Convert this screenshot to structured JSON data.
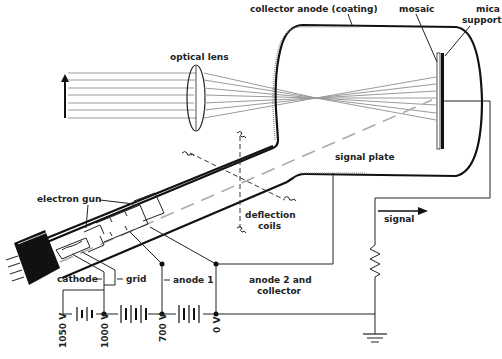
{
  "diagram": {
    "labels": {
      "optical_lens": "optical lens",
      "collector_anode": "collector anode (coating)",
      "mosaic": "mosaic",
      "mica_support_line1": "mica",
      "mica_support_line2": "support",
      "signal_plate": "signal plate",
      "electron_gun": "electron gun",
      "deflection_coils_line1": "deflection",
      "deflection_coils_line2": "coils",
      "signal": "signal",
      "cathode": "cathode",
      "grid": "grid",
      "anode1": "anode 1",
      "anode2_line1": "anode 2 and",
      "anode2_line2": "collector"
    },
    "voltages": [
      "1050 V",
      "1000 V",
      "700 V",
      "0 V"
    ],
    "colors": {
      "line": "#111111",
      "ray": "#9a9a9a",
      "beam_dash": "#aaaaaa",
      "background": "#ffffff"
    }
  }
}
